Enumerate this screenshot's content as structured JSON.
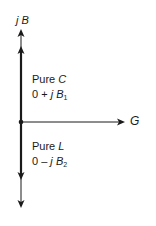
{
  "diagram": {
    "axes": {
      "vertical": {
        "label_prefix": "j",
        "label_var": "B"
      },
      "horizontal": {
        "label": "G"
      }
    },
    "upper_vector": {
      "title_prefix": "Pure ",
      "title_var": "C",
      "expr_prefix": "0 + ",
      "expr_j": "j",
      "expr_var": "B",
      "expr_sub": "1"
    },
    "lower_vector": {
      "title_prefix": "Pure ",
      "title_var": "L",
      "expr_prefix": "0 – ",
      "expr_j": "j",
      "expr_var": "B",
      "expr_sub": "2"
    },
    "colors": {
      "line": "#1a1a1a",
      "background": "#ffffff"
    }
  }
}
